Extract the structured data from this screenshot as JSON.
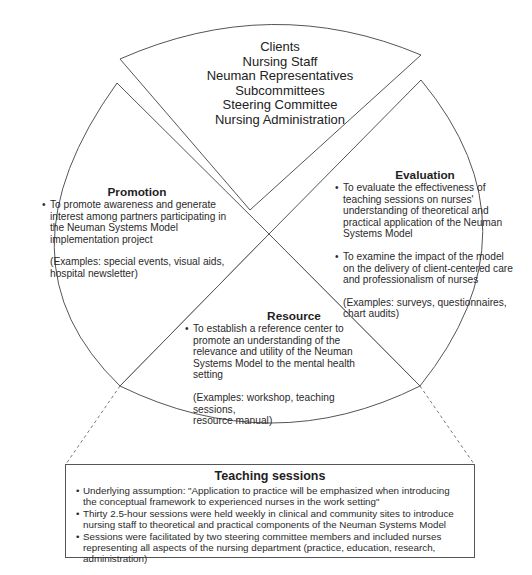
{
  "stakeholders": {
    "items": [
      "Clients",
      "Nursing Staff",
      "Neuman Representatives",
      "Subcommittees",
      "Steering Committee",
      "Nursing Administration"
    ]
  },
  "promotion": {
    "title": "Promotion",
    "bullets": [
      "To promote awareness and generate interest among partners participating in the Neuman Systems Model implementation project"
    ],
    "example_lines": [
      "(Examples: special events, visual aids,",
      "hospital newsletter)"
    ]
  },
  "evaluation": {
    "title": "Evaluation",
    "bullets": [
      "To evaluate the effectiveness of teaching sessions on nurses' understanding of theoretical and practical application of the Neuman Systems Model",
      "To examine the impact of the model on the delivery of client-centered care and professionalism of nurses"
    ],
    "example_lines": [
      "(Examples: surveys, questionnaires,",
      "chart audits)"
    ]
  },
  "resource": {
    "title": "Resource",
    "bullets": [
      "To establish a reference center to promote  an understanding of the relevance and utility of the Neuman Systems Model to the mental health setting"
    ],
    "example_lines": [
      "(Examples: workshop, teaching sessions,",
      "resource manual)"
    ]
  },
  "teaching_sessions": {
    "title": "Teaching sessions",
    "bullets": [
      "Underlying assumption: \"Application to practice will be emphasized when introducing the conceptual framework to experienced nurses in the work setting\"",
      "Thirty 2.5-hour sessions were held weekly in clinical and community sites to introduce nursing staff to theoretical and practical components of the Neuman Systems Model",
      "Sessions were facilitated by two steering committee members and included nurses representing all aspects of the nursing department (practice, education, research, administration)"
    ]
  },
  "colors": {
    "line": "#555555",
    "text": "#2a2a2a",
    "background": "#ffffff"
  }
}
